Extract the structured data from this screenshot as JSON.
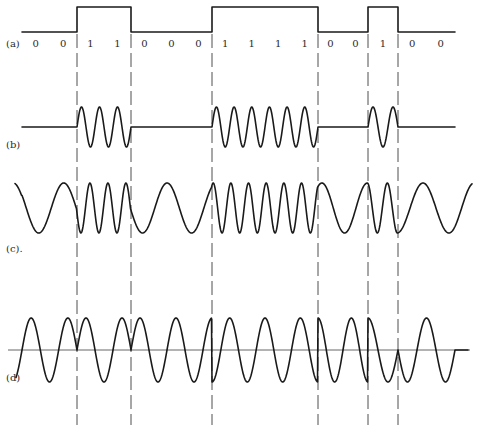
{
  "chart_data": {
    "type": "line",
    "title": "",
    "bits": [
      0,
      0,
      1,
      1,
      0,
      0,
      0,
      1,
      1,
      1,
      1,
      0,
      0,
      1,
      0,
      0
    ],
    "bit_labels": [
      "0",
      "0",
      "1",
      "1",
      "0",
      "0",
      "0",
      "1",
      "1",
      "1",
      "1",
      "0",
      "0",
      "1",
      "0",
      "0"
    ],
    "transition_bit_indices": [
      2,
      4,
      7,
      11,
      13,
      14
    ],
    "panels": [
      {
        "id": "a",
        "label": "(a)",
        "kind": "binary-data"
      },
      {
        "id": "b",
        "label": "(b)",
        "kind": "ask",
        "cycles_per_bit_on": 1.5,
        "amplitude_off": 0
      },
      {
        "id": "c",
        "label": "(c).",
        "kind": "fsk",
        "cycles_per_bit_zero": 0.55,
        "cycles_per_bit_one": 1.5
      },
      {
        "id": "d",
        "label": "(d)",
        "kind": "psk",
        "cycles_per_bit": 0.75,
        "has_zero_axis": true
      }
    ],
    "guide_lines": "dashed vertical lines at each bit transition",
    "xlabel": "",
    "ylabel": ""
  },
  "colors": {
    "ink": "#1a1a1a",
    "guide": "#3a3a3a",
    "background": "#ffffff"
  }
}
